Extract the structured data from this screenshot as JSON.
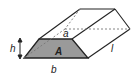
{
  "diagram": {
    "type": "trapezoidal prism",
    "labels": {
      "top_base": "a",
      "bottom_base": "b",
      "height": "h",
      "area": "A",
      "length": "l"
    },
    "colors": {
      "face_fill": "#9a9a9a",
      "stroke": "#222222",
      "hidden_edge": "#777777"
    }
  }
}
